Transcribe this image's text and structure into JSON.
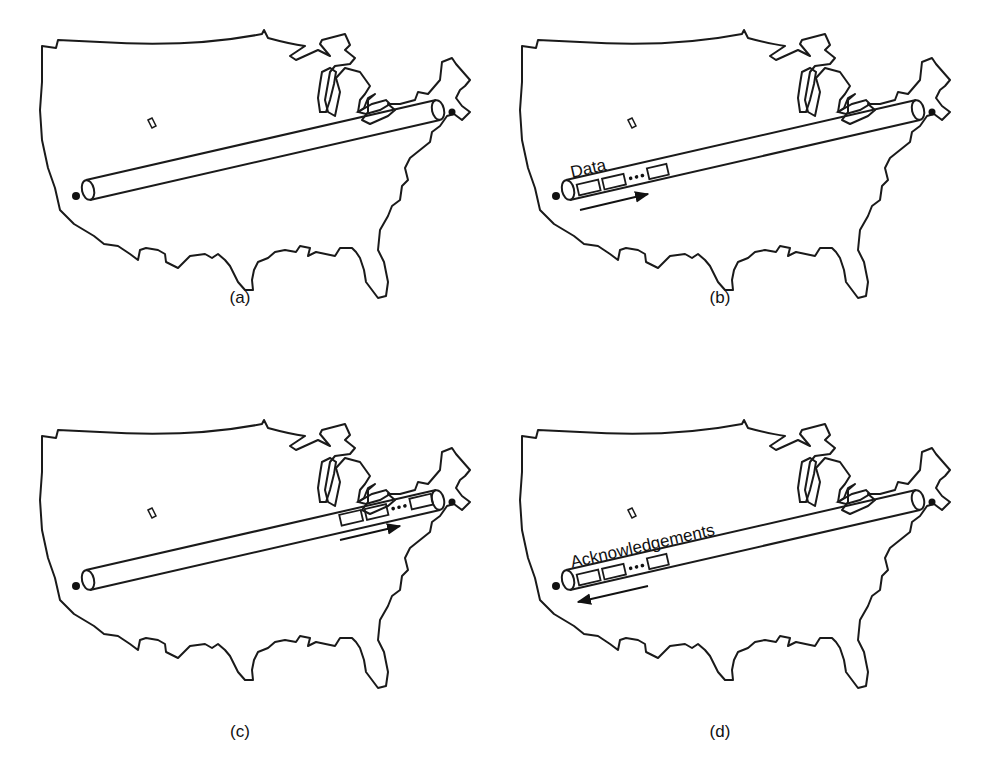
{
  "figure": {
    "panels": [
      {
        "id": "a",
        "caption": "(a)",
        "pipe_label": "",
        "packets": "none",
        "arrow": "none"
      },
      {
        "id": "b",
        "caption": "(b)",
        "pipe_label": "Data",
        "packets": "west-end",
        "arrow": "east"
      },
      {
        "id": "c",
        "caption": "(c)",
        "pipe_label": "",
        "packets": "east-end",
        "arrow": "east"
      },
      {
        "id": "d",
        "caption": "(d)",
        "pipe_label": "Acknowledgements",
        "packets": "west-end",
        "arrow": "west"
      }
    ],
    "colors": {
      "stroke": "#1a1a1a",
      "background": "#ffffff"
    }
  }
}
